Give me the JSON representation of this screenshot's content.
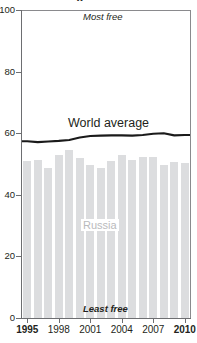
{
  "chart_data": {
    "type": "bar",
    "title": "",
    "title_cut_fragment": "y",
    "xlabel": "",
    "ylabel": "",
    "ylim": [
      0,
      100
    ],
    "yticks": [
      0,
      20,
      40,
      60,
      80,
      100
    ],
    "ytick_labels": [
      "0",
      "20",
      "40",
      "60",
      "80",
      "100"
    ],
    "xticks": [
      1995,
      1998,
      2001,
      2004,
      2007,
      2010
    ],
    "xtick_labels": [
      "1995",
      "1998",
      "2001",
      "2004",
      "2007",
      "2010"
    ],
    "grid": false,
    "legend": "none",
    "categories": [
      "1995",
      "1996",
      "1997",
      "1998",
      "1999",
      "2000",
      "2001",
      "2002",
      "2003",
      "2004",
      "2005",
      "2006",
      "2007",
      "2008",
      "2009",
      "2010"
    ],
    "series": [
      {
        "name": "Russia",
        "type": "bar",
        "color": "#dcdddf",
        "values": [
          51.0,
          51.4,
          48.6,
          52.8,
          54.5,
          51.8,
          49.8,
          48.8,
          51.0,
          52.8,
          51.2,
          52.4,
          52.2,
          49.7,
          50.8,
          50.3
        ]
      },
      {
        "name": "World average",
        "type": "line",
        "color": "#1a1a1a",
        "values": [
          57.4,
          57.1,
          57.3,
          57.5,
          57.8,
          58.6,
          59.1,
          59.2,
          59.3,
          59.3,
          59.2,
          59.4,
          59.8,
          60.0,
          59.3,
          59.4
        ]
      }
    ],
    "annotations": [
      {
        "name": "most-free",
        "text": "Most free",
        "position": "top",
        "style": "italic"
      },
      {
        "name": "least-free",
        "text": "Least free",
        "position": "bottom",
        "style": "italic-bold"
      },
      {
        "name": "world-average-label",
        "text": "World average",
        "position": "inline-line"
      },
      {
        "name": "russia-label",
        "text": "Russia",
        "position": "inside-bars"
      }
    ],
    "colors": {
      "bar": "#dcdddf",
      "line": "#1a1a1a",
      "axis": "#6d6e71",
      "russia_label": "#b9babc",
      "background": "#ffffff"
    }
  }
}
